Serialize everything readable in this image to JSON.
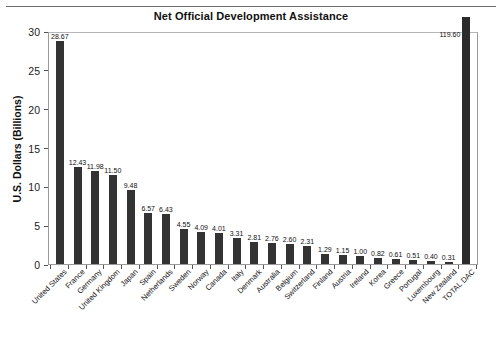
{
  "figure": {
    "title": "Net Official Development Assistance",
    "caption": ""
  },
  "chart_data": {
    "type": "bar",
    "title": "Net Official Development Assistance",
    "xlabel": "",
    "ylabel": "U.S. Dollars (Billions)",
    "ylim": [
      0,
      30
    ],
    "yticks": [
      0,
      5,
      10,
      15,
      20,
      25,
      30
    ],
    "ytick_labels": [
      "0",
      "5",
      "10",
      "15",
      "20",
      "25",
      "30"
    ],
    "grid": false,
    "legend": false,
    "bar_color": "#333333",
    "note": "The TOTAL DAC bar is clipped by the axis maximum; its true value is 119.60.",
    "categories": [
      "United States",
      "France",
      "Germany",
      "United Kingdom",
      "Japan",
      "Spain",
      "Netherlands",
      "Sweden",
      "Norway",
      "Canada",
      "Italy",
      "Denmark",
      "Australia",
      "Belgium",
      "Switzerland",
      "Finland",
      "Austria",
      "Ireland",
      "Korea",
      "Greece",
      "Portugal",
      "Luxembourg",
      "New Zealand",
      "TOTAL DAC"
    ],
    "values": [
      28.67,
      12.43,
      11.98,
      11.5,
      9.48,
      6.57,
      6.43,
      4.55,
      4.09,
      4.01,
      3.31,
      2.81,
      2.76,
      2.6,
      2.31,
      1.29,
      1.15,
      1.0,
      0.82,
      0.61,
      0.51,
      0.4,
      0.31,
      119.6
    ],
    "value_labels": [
      "28.67",
      "12.43",
      "11.98",
      "11.50",
      "9.48",
      "6.57",
      "6.43",
      "4.55",
      "4.09",
      "4.01",
      "3.31",
      "2.81",
      "2.76",
      "2.60",
      "2.31",
      "1.29",
      "1.15",
      "1.00",
      "0.82",
      "0.61",
      "0.51",
      "0.40",
      "0.31",
      "119.60"
    ]
  }
}
